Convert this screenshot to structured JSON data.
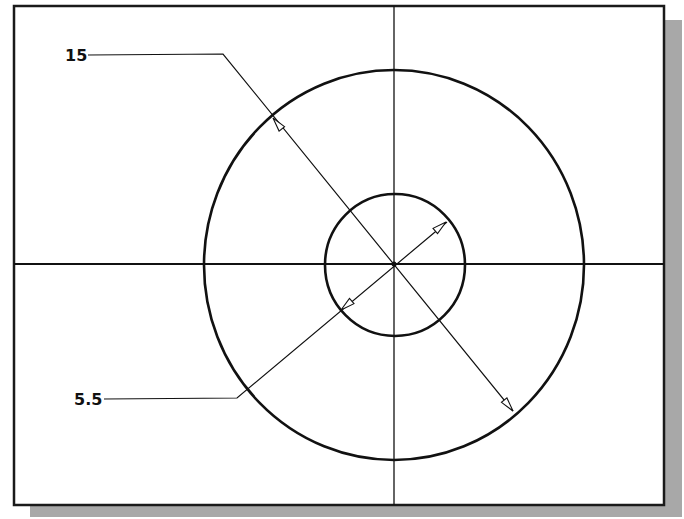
{
  "diagram": {
    "type": "cad-drawing",
    "colors": {
      "background": "#ffffff",
      "line": "#111111",
      "shadow": "#a6a6a6",
      "frame": "#1a1a1a"
    },
    "frame": {
      "x": 14,
      "y": 6,
      "width": 650,
      "height": 499
    },
    "center": {
      "x": 394,
      "y": 264
    },
    "outer_circle": {
      "rx": 190,
      "ry": 195
    },
    "inner_circle": {
      "rx": 70,
      "ry": 71
    },
    "dimensions": [
      {
        "id": "outer-diameter",
        "label": "15"
      },
      {
        "id": "inner-diameter",
        "label": "5.5"
      }
    ]
  }
}
